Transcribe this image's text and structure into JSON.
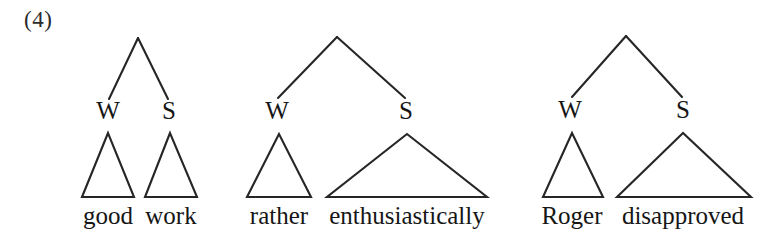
{
  "figure": {
    "example_number": "(4)",
    "line_color": "#262626",
    "background_color": "#ffffff",
    "text_color": "#161616"
  },
  "trees": [
    {
      "id": "tree-1",
      "root": {
        "x": 138,
        "y": 38
      },
      "nodes": [
        {
          "label": "W",
          "label_x": 108,
          "label_y": 98,
          "branch_end_x": 109,
          "branch_end_y": 99,
          "triangle": {
            "apex_x": 108,
            "apex_y": 133,
            "left_x": 82,
            "right_x": 134,
            "base_y": 197
          },
          "word": "good",
          "word_x": 108,
          "word_y": 203
        },
        {
          "label": "S",
          "label_x": 169,
          "label_y": 98,
          "branch_end_x": 168,
          "branch_end_y": 99,
          "triangle": {
            "apex_x": 170,
            "apex_y": 133,
            "left_x": 145,
            "right_x": 197,
            "base_y": 197
          },
          "word": "work",
          "word_x": 171,
          "word_y": 203
        }
      ]
    },
    {
      "id": "tree-2",
      "root": {
        "x": 337,
        "y": 37
      },
      "nodes": [
        {
          "label": "W",
          "label_x": 277,
          "label_y": 98,
          "branch_end_x": 278,
          "branch_end_y": 98,
          "triangle": {
            "apex_x": 279,
            "apex_y": 134,
            "left_x": 247,
            "right_x": 311,
            "base_y": 197
          },
          "word": "rather",
          "word_x": 279,
          "word_y": 203
        },
        {
          "label": "S",
          "label_x": 406,
          "label_y": 98,
          "branch_end_x": 405,
          "branch_end_y": 98,
          "triangle": {
            "apex_x": 407,
            "apex_y": 134,
            "left_x": 327,
            "right_x": 487,
            "base_y": 197
          },
          "word": "enthusiastically",
          "word_x": 407,
          "word_y": 203
        }
      ]
    },
    {
      "id": "tree-3",
      "root": {
        "x": 626,
        "y": 36
      },
      "nodes": [
        {
          "label": "W",
          "label_x": 570,
          "label_y": 97,
          "branch_end_x": 572,
          "branch_end_y": 97,
          "triangle": {
            "apex_x": 572,
            "apex_y": 133,
            "left_x": 543,
            "right_x": 603,
            "base_y": 197
          },
          "word": "Roger",
          "word_x": 572,
          "word_y": 203
        },
        {
          "label": "S",
          "label_x": 683,
          "label_y": 97,
          "branch_end_x": 682,
          "branch_end_y": 97,
          "triangle": {
            "apex_x": 683,
            "apex_y": 133,
            "left_x": 617,
            "right_x": 751,
            "base_y": 197
          },
          "word": "disapproved",
          "word_x": 683,
          "word_y": 203
        }
      ]
    }
  ]
}
